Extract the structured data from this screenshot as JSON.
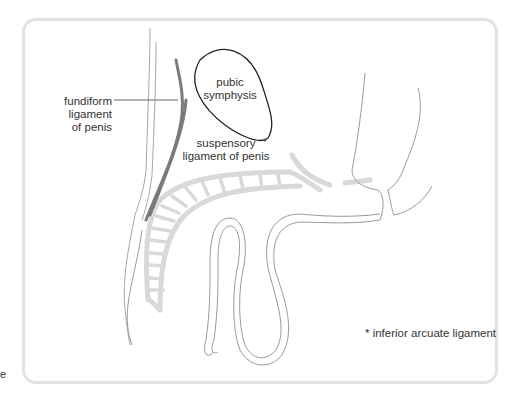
{
  "diagram": {
    "title": "",
    "labels": {
      "fundiform": [
        "fundiform",
        "ligament",
        "of penis"
      ],
      "pubic": [
        "pubic",
        "symphysis"
      ],
      "suspensory": [
        "suspensory",
        "ligament of penis"
      ],
      "footnote": "* inferior arcuate ligament",
      "stray_glyph": "e"
    },
    "colors": {
      "outline": "#9a9a9a",
      "bone_outline": "#222222",
      "ligament_dark": "#7a7a7a",
      "tissue_light": "#d9d9d9",
      "panel_border": "#e2e2e2",
      "text": "#333333"
    }
  }
}
